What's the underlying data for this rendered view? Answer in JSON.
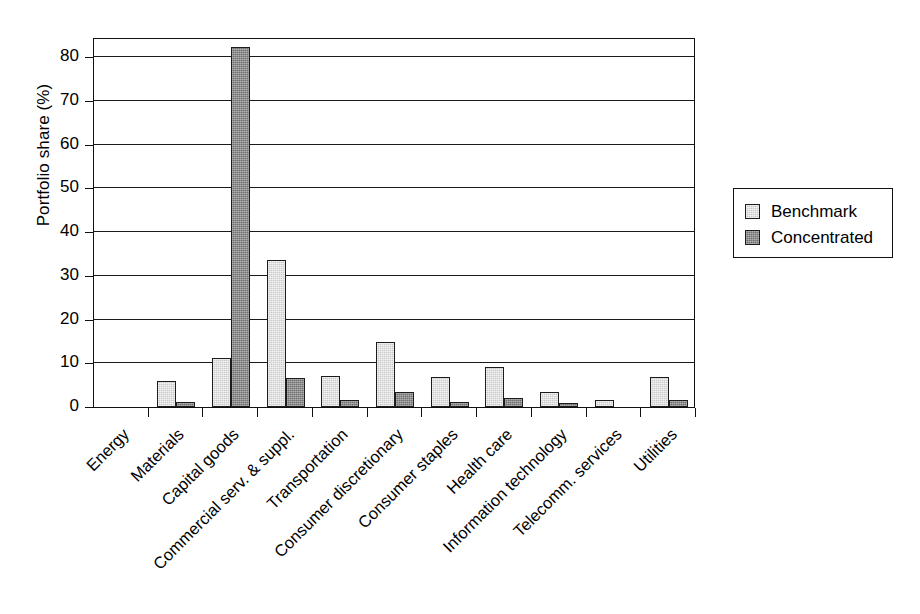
{
  "chart_data": {
    "type": "bar",
    "title": "",
    "xlabel": "",
    "ylabel": "Portfolio share (%)",
    "ylim": [
      0,
      84.6
    ],
    "yticks": [
      0,
      10,
      20,
      30,
      40,
      50,
      60,
      70,
      80
    ],
    "grid": true,
    "legend_position": "right",
    "categories": [
      "Energy",
      "Materials",
      "Capital goods",
      "Commercial serv. & suppl.",
      "Transportation",
      "Consumer discretionary",
      "Consumer staples",
      "Health care",
      "Information technology",
      "Telecomm. services",
      "Utilities"
    ],
    "series": [
      {
        "name": "Benchmark",
        "color": "#c9c9c9",
        "values": [
          0,
          5.9,
          11.3,
          33.7,
          7.1,
          14.9,
          6.9,
          9.1,
          3.5,
          1.5,
          6.9
        ]
      },
      {
        "name": "Concentrated",
        "color": "#6f6f6f",
        "values": [
          0,
          1.2,
          82.3,
          6.7,
          1.6,
          3.4,
          1.2,
          2.1,
          0.9,
          0,
          1.5
        ]
      }
    ]
  },
  "legend": {
    "items": [
      {
        "label": "Benchmark",
        "swatch": "benchmark"
      },
      {
        "label": "Concentrated",
        "swatch": "concentrated"
      }
    ]
  },
  "axis": {
    "y_title": "Portfolio share (%)"
  }
}
